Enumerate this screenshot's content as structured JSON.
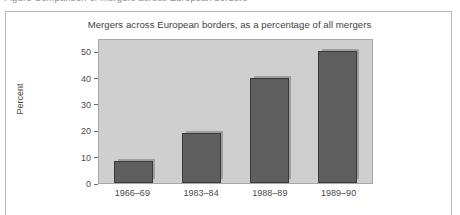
{
  "caption": {
    "text": "Figure   Comparison of mergers across European borders"
  },
  "figure": {
    "title": "Mergers across European borders, as a percentage of all mergers"
  },
  "axes": {
    "y_title": "Percent",
    "y_ticks": [
      "0",
      "10",
      "20",
      "30",
      "40",
      "50"
    ]
  },
  "chart_data": {
    "type": "bar",
    "title": "Mergers across European borders, as a percentage of all mergers",
    "categories": [
      "1966–69",
      "1983–84",
      "1988–89",
      "1989–90"
    ],
    "values": [
      8.5,
      19,
      40,
      50
    ],
    "xlabel": "",
    "ylabel": "Percent",
    "ylim": [
      0,
      55
    ],
    "yticks": [
      0,
      10,
      20,
      30,
      40,
      50
    ],
    "grid": false,
    "legend": "none",
    "bar_color": "#5f5f5f",
    "bar_border_color": "#3a3a3a",
    "panel_color": "#cfcfcf",
    "frame_color": "#b9b9bd"
  }
}
